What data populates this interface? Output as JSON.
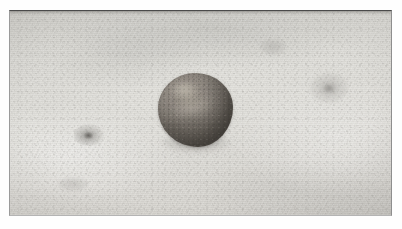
{
  "image": {
    "kind": "photograph",
    "caption": "A small rounded grey-brown clay ball resting on a pale textured stone surface",
    "orientation": "landscape",
    "width_px": 402,
    "height_px": 229
  },
  "frame": {
    "name": "photo-border",
    "margin_color": "#fefefe",
    "border_top_color": "#4a4a4a",
    "border_left_color": "#9a9a9a",
    "border_right_color": "#8e8e8e",
    "border_bottom_color": "#b4b4b4"
  },
  "scene": {
    "background": {
      "name": "stone-surface",
      "description": "Pale warm-grey plaster or stone slab with fine granular texture and faint horizontal striations",
      "base_color": "#dedcd7",
      "light_color": "#e6e5e0",
      "shadow_color": "#cbc9c4"
    },
    "subject": {
      "name": "clay-ball",
      "description": "Roughly spherical lump of clay, slightly flattened at the base, with a mottled pitted surface",
      "body_color": "#8e8780",
      "highlight_color": "#b9b3a8",
      "shadow_color": "#6e6861",
      "bounds": {
        "left_px": 158,
        "top_px": 73,
        "width_px": 74,
        "height_px": 74
      }
    },
    "marks": [
      {
        "name": "surface-blemish-left",
        "description": "Small dark smudge on the slab left of the ball",
        "color": "#68665f"
      },
      {
        "name": "surface-blemish-right",
        "description": "Faint grey mottled patch on the slab right of the ball",
        "color": "#8c8a86"
      }
    ]
  }
}
